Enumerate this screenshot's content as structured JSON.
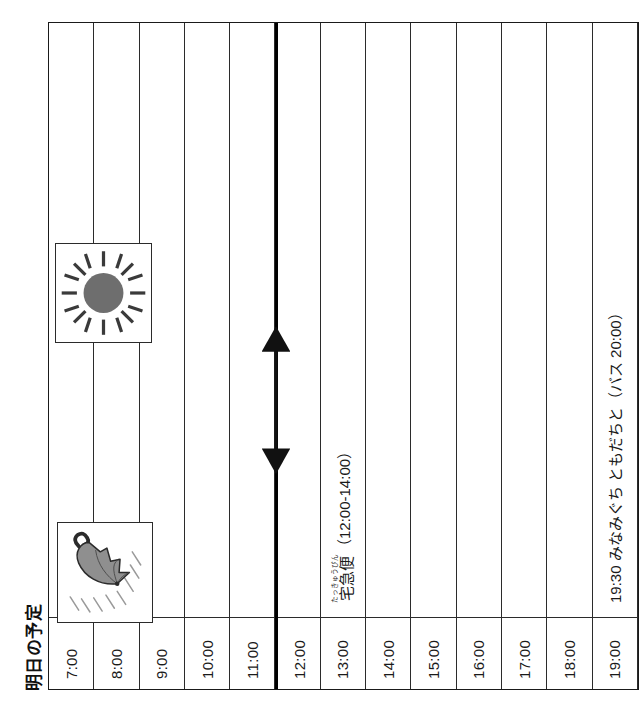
{
  "page": {
    "title": "明日の予定",
    "language": "ja"
  },
  "colors": {
    "ink": "#1a1a1a",
    "rule": "#2b2b2b",
    "thick_rule": "#000000",
    "umbrella_fill": "#8c8c8c",
    "sun_fill": "#6e6e6e",
    "paper": "#ffffff"
  },
  "schedule": {
    "time_column_header": "",
    "rows": [
      {
        "time": "7:00",
        "note": "",
        "ruby": "お",
        "ruby_base": "起",
        "note_tail": "きる？",
        "has_note": true,
        "thick_top": false
      },
      {
        "time": "8:00",
        "note": "",
        "has_note": false,
        "thick_top": false
      },
      {
        "time": "9:00",
        "note": "",
        "has_note": false,
        "thick_top": false
      },
      {
        "time": "10:00",
        "note": "",
        "has_note": false,
        "thick_top": false
      },
      {
        "time": "11:00",
        "note": "",
        "has_note": false,
        "thick_top": false
      },
      {
        "time": "12:00",
        "note": "",
        "has_note": false,
        "thick_top": true
      },
      {
        "time": "13:00",
        "note": "",
        "ruby": "たっきゅうびん",
        "ruby_base": "宅急便",
        "note_tail": "（12:00-14:00）",
        "has_note": true,
        "thick_top": false
      },
      {
        "time": "14:00",
        "note": "",
        "has_note": false,
        "thick_top": false
      },
      {
        "time": "15:00",
        "note": "",
        "has_note": false,
        "thick_top": false
      },
      {
        "time": "16:00",
        "note": "",
        "has_note": false,
        "thick_top": false
      },
      {
        "time": "17:00",
        "note": "",
        "has_note": false,
        "thick_top": false
      },
      {
        "time": "18:00",
        "note": "",
        "has_note": false,
        "thick_top": false
      },
      {
        "time": "19:00",
        "note": "19:30 みなみぐち ともだちと（バス 20:00）",
        "has_note": true,
        "thick_top": false
      }
    ]
  },
  "annotations": {
    "morning_note": {
      "ruby": "お",
      "base": "起",
      "tail": "きる？",
      "full_text": "起きる？",
      "row_time": "7:00"
    },
    "delivery": {
      "ruby": "たっきゅうびん",
      "base": "宅急便",
      "tail": "（12:00-14:00）",
      "full_text": "宅急便（12:00-14:00）",
      "range_start": "12:00",
      "range_end": "14:00",
      "row_time": "13:00",
      "arrow_style": "double-headed"
    },
    "evening_note": {
      "full_text": "19:30 みなみぐち ともだちと（バス 20:00）",
      "meeting_time": "19:30",
      "place": "みなみぐち",
      "with": "ともだちと",
      "bus_time": "バス 20:00",
      "row_time": "19:00"
    }
  },
  "weather_icons": [
    {
      "name": "umbrella-rain-icon",
      "label": "あめ",
      "span_start": "7:00",
      "span_end": "9:00"
    },
    {
      "name": "sun-icon",
      "label": "はれ",
      "span_start": "14:00",
      "span_end": "16:00"
    }
  ]
}
